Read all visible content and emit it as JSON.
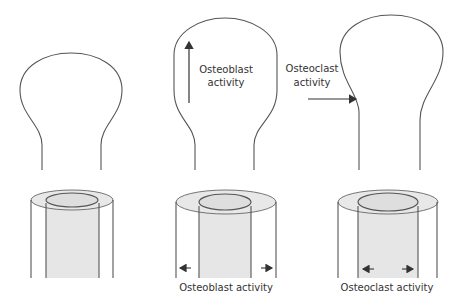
{
  "diagram": {
    "panels": [
      {
        "id": "baseline",
        "bone_end": {
          "shape": "bulb"
        },
        "cross_section": {
          "arrows": "none",
          "label": ""
        }
      },
      {
        "id": "osteoblast",
        "bone_end": {
          "shape": "bulb-expanded",
          "annotation": {
            "line1": "Osteoblast",
            "line2": "activity",
            "arrow": "up"
          }
        },
        "cross_section": {
          "arrows": "outward-outer",
          "label": "Osteoblast activity"
        }
      },
      {
        "id": "osteoclast",
        "bone_end": {
          "shape": "bulb-narrowed-neck",
          "annotation": {
            "line1": "Osteoclast",
            "line2": "activity",
            "arrow": "right"
          }
        },
        "cross_section": {
          "arrows": "outward-inner",
          "label": "Osteoclast activity"
        }
      }
    ],
    "colors": {
      "line": "#555555",
      "fill": "#e6e6e6",
      "ring": "#dcdcdc",
      "text": "#333333"
    }
  }
}
